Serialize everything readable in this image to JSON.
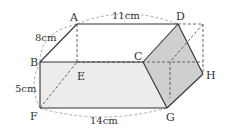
{
  "figure": {
    "type": "prism-diagram",
    "vertices": {
      "A": "A",
      "B": "B",
      "C": "C",
      "D": "D",
      "E": "E",
      "F": "F",
      "G": "G",
      "H": "H"
    },
    "dimensions": {
      "top": "11cm",
      "depth": "8cm",
      "height": "5cm",
      "bottom": "14cm"
    },
    "colors": {
      "edge": "#333333",
      "hidden_edge": "#555555",
      "front_face_fill": "#ececec",
      "cut_face_fill": "#cfcfcf",
      "arc": "#9a9a9a"
    }
  }
}
